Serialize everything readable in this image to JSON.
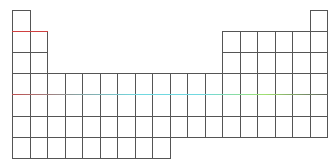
{
  "diagram": {
    "type": "periodic-table-outline",
    "origin": {
      "x": 12,
      "y": 10
    },
    "cell_width": 17.5,
    "cell_height": 21.1,
    "columns": 18,
    "rows": 7,
    "line_color": "#555555",
    "occupied": [
      {
        "row": 1,
        "cols": [
          1,
          18
        ]
      },
      {
        "row": 2,
        "cols": [
          1,
          2,
          13,
          14,
          15,
          16,
          17,
          18
        ]
      },
      {
        "row": 3,
        "cols": [
          1,
          2,
          13,
          14,
          15,
          16,
          17,
          18
        ]
      },
      {
        "row": 4,
        "cols": [
          1,
          2,
          3,
          4,
          5,
          6,
          7,
          8,
          9,
          10,
          11,
          12,
          13,
          14,
          15,
          16,
          17,
          18
        ]
      },
      {
        "row": 5,
        "cols": [
          1,
          2,
          3,
          4,
          5,
          6,
          7,
          8,
          9,
          10,
          11,
          12,
          13,
          14,
          15,
          16,
          17,
          18
        ]
      },
      {
        "row": 6,
        "cols": [
          1,
          2,
          3,
          4,
          5,
          6,
          7,
          8,
          9,
          10,
          11,
          12,
          13,
          14,
          15,
          16,
          17,
          18
        ]
      },
      {
        "row": 7,
        "cols": [
          1,
          2,
          3,
          4,
          5,
          6,
          7,
          8,
          9
        ]
      }
    ],
    "accent_lines": [
      {
        "name": "row2-top-accent",
        "row_line": 2,
        "from_col": 1,
        "to_col": 2,
        "gradient": [
          "#d04040",
          "#d04040"
        ]
      },
      {
        "name": "row5-top-accent",
        "row_line": 5,
        "from_col": 1,
        "to_col": 18,
        "gradient": [
          "#c05050",
          "#8aa0a0",
          "#70d8e0",
          "#70d8e0",
          "#a0e070",
          "#606060"
        ]
      }
    ]
  }
}
